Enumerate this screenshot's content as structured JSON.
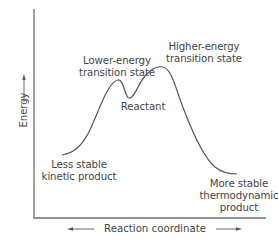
{
  "diagram": {
    "type": "reaction-energy-profile",
    "axes": {
      "y_label": "Energy",
      "x_label": "Reaction coordinate"
    },
    "labels": {
      "lower_ts_line1": "Lower-energy",
      "lower_ts_line2": "transition state",
      "higher_ts_line1": "Higher-energy",
      "higher_ts_line2": "transition state",
      "reactant": "Reactant",
      "kinetic_line1": "Less stable",
      "kinetic_line2": "kinetic product",
      "thermo_line1": "More stable",
      "thermo_line2": "thermodynamic",
      "thermo_line3": "product"
    },
    "curve_points": [
      {
        "name": "Less stable kinetic product",
        "x": 62,
        "y": 155
      },
      {
        "name": "Lower-energy transition state",
        "x": 118,
        "y": 80
      },
      {
        "name": "Reactant",
        "x": 129,
        "y": 98
      },
      {
        "name": "Higher-energy transition state",
        "x": 163,
        "y": 67
      },
      {
        "name": "More stable thermodynamic product",
        "x": 237,
        "y": 174
      }
    ],
    "colors": {
      "axis": "#6b6b6b",
      "curve": "#555555",
      "text": "#444444"
    }
  }
}
